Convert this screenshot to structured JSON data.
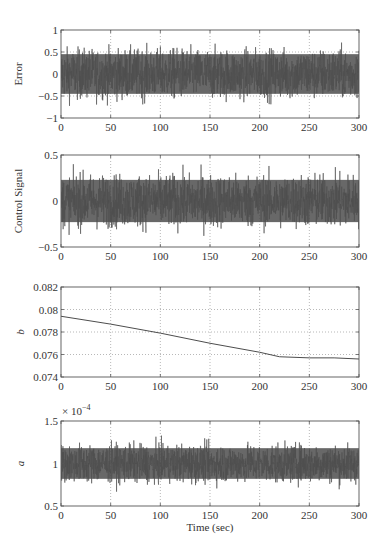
{
  "figure": {
    "xlabel": "Time (sec)",
    "colors": {
      "signal": "#4d4d4d",
      "axis": "#555555",
      "grid": "#9a9a9a",
      "text": "#333333"
    }
  },
  "chart_data": [
    {
      "type": "line",
      "title": "",
      "ylabel": "Error",
      "xlabel": "",
      "xlim": [
        0,
        300
      ],
      "ylim": [
        -1,
        1
      ],
      "xticks": [
        0,
        50,
        100,
        150,
        200,
        250,
        300
      ],
      "yticks": [
        -1,
        -0.5,
        0,
        0.5,
        1
      ],
      "ytick_labels": [
        "−1",
        "−0.5",
        "0",
        "0.5",
        "1"
      ],
      "grid": true,
      "series": [
        {
          "name": "Error",
          "kind": "noise",
          "mean": 0,
          "envelope": 0.55,
          "peak": 0.8
        }
      ]
    },
    {
      "type": "line",
      "title": "",
      "ylabel": "Control Signal",
      "xlabel": "",
      "xlim": [
        0,
        300
      ],
      "ylim": [
        -0.5,
        0.5
      ],
      "xticks": [
        0,
        50,
        100,
        150,
        200,
        250,
        300
      ],
      "yticks": [
        -0.5,
        0,
        0.5
      ],
      "ytick_labels": [
        "−0.5",
        "0",
        "0.5"
      ],
      "grid": true,
      "series": [
        {
          "name": "Control Signal",
          "kind": "noise",
          "mean": 0,
          "envelope": 0.28,
          "peak": 0.4
        }
      ]
    },
    {
      "type": "line",
      "title": "",
      "ylabel": "b",
      "xlabel": "",
      "xlim": [
        0,
        300
      ],
      "ylim": [
        0.074,
        0.082
      ],
      "xticks": [
        0,
        50,
        100,
        150,
        200,
        250,
        300
      ],
      "yticks": [
        0.074,
        0.076,
        0.078,
        0.08,
        0.082
      ],
      "ytick_labels": [
        "0.074",
        "0.076",
        "0.078",
        "0.08",
        "0.082"
      ],
      "grid": true,
      "series": [
        {
          "name": "b",
          "kind": "line",
          "x": [
            0,
            50,
            100,
            150,
            200,
            220,
            250,
            275,
            300
          ],
          "y": [
            0.0794,
            0.0787,
            0.0779,
            0.077,
            0.0762,
            0.0758,
            0.0757,
            0.0757,
            0.0756
          ]
        }
      ]
    },
    {
      "type": "line",
      "title": "",
      "ylabel": "a",
      "xlabel": "Time (sec)",
      "xlim": [
        0,
        300
      ],
      "ylim": [
        0.5,
        1.5
      ],
      "y_scale_note": "× 10^−4",
      "xticks": [
        0,
        50,
        100,
        150,
        200,
        250,
        300
      ],
      "yticks": [
        0.5,
        1,
        1.5
      ],
      "ytick_labels": [
        "0.5",
        "1",
        "1.5"
      ],
      "grid": true,
      "series": [
        {
          "name": "a",
          "kind": "noise",
          "mean": 1.0,
          "envelope": 0.22,
          "peak": 0.38
        }
      ]
    }
  ],
  "panels_layout": [
    {
      "left": 61,
      "right": 359,
      "top": 30,
      "bottom": 118
    },
    {
      "left": 61,
      "right": 359,
      "top": 155,
      "bottom": 247
    },
    {
      "left": 61,
      "right": 359,
      "top": 287,
      "bottom": 377
    },
    {
      "left": 61,
      "right": 359,
      "top": 421,
      "bottom": 506
    }
  ],
  "exponent_label": {
    "base": "× 10",
    "exp": "−4"
  }
}
